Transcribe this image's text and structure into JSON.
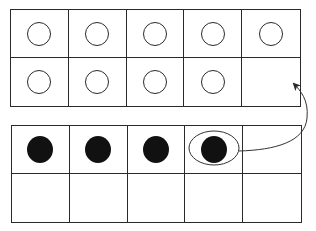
{
  "diagram": {
    "type": "ten-frames",
    "colors": {
      "line": "#2a2a2a",
      "filled_counter": "#111111",
      "empty_counter_fill": "#ffffff",
      "background": "#ffffff"
    },
    "top_frame": {
      "rows": 2,
      "cols": 5,
      "cells": [
        "empty-counter",
        "empty-counter",
        "empty-counter",
        "empty-counter",
        "empty-counter",
        "empty-counter",
        "empty-counter",
        "empty-counter",
        "empty-counter",
        "blank"
      ],
      "counter_count": 9
    },
    "bottom_frame": {
      "rows": 2,
      "cols": 5,
      "cells": [
        "filled-counter",
        "filled-counter",
        "filled-counter",
        "filled-counter",
        "blank",
        "blank",
        "blank",
        "blank",
        "blank",
        "blank"
      ],
      "counter_count": 4,
      "circled_cell_index": 3
    },
    "arrow": {
      "from": "bottom_frame.cell.3 (circled counter)",
      "to": "top_frame.cell.9 (empty cell)",
      "style": "curved, thin line with arrowhead"
    }
  }
}
